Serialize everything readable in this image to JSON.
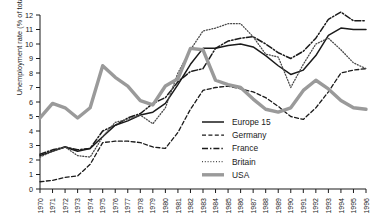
{
  "chart_data": {
    "type": "line",
    "title": "",
    "xlabel": "",
    "ylabel": "Unemployment rate (% of total workforce)",
    "xlim": [
      1970,
      1996
    ],
    "ylim": [
      0,
      12
    ],
    "grid": false,
    "legend_position": "center-right-inside",
    "x": [
      1970,
      1971,
      1972,
      1973,
      1974,
      1975,
      1976,
      1977,
      1978,
      1979,
      1980,
      1981,
      1982,
      1983,
      1984,
      1985,
      1986,
      1987,
      1988,
      1989,
      1990,
      1991,
      1992,
      1993,
      1994,
      1995,
      1996
    ],
    "xtick_labels": [
      "1970",
      "1971",
      "1972",
      "1973",
      "1974",
      "1975",
      "1976",
      "1977",
      "1978",
      "1979",
      "1980",
      "1981",
      "1982",
      "1983",
      "1984",
      "1985",
      "1986",
      "1987",
      "1988",
      "1989",
      "1990",
      "1991",
      "1992",
      "1993",
      "1994",
      "1995",
      "1996"
    ],
    "ytick_labels": [
      "0",
      "1",
      "2",
      "3",
      "4",
      "5",
      "6",
      "7",
      "8",
      "9",
      "10",
      "11",
      "12"
    ],
    "series": [
      {
        "name": "Europe 15",
        "style": "solid",
        "color": "#1a1a1a",
        "width": 1.5,
        "values": [
          2.3,
          2.6,
          2.9,
          2.6,
          2.8,
          3.6,
          4.4,
          4.7,
          5.1,
          5.3,
          5.9,
          7.2,
          8.6,
          9.7,
          9.7,
          9.9,
          10.0,
          9.8,
          9.2,
          8.5,
          7.9,
          8.2,
          9.2,
          10.6,
          11.1,
          11.0,
          11.0
        ]
      },
      {
        "name": "Germany",
        "style": "dashed",
        "color": "#1a1a1a",
        "width": 1.3,
        "values": [
          0.5,
          0.6,
          0.8,
          0.9,
          1.7,
          3.2,
          3.3,
          3.3,
          3.2,
          2.9,
          2.8,
          3.9,
          5.5,
          6.8,
          7.0,
          7.1,
          6.9,
          6.7,
          6.3,
          5.7,
          5.0,
          4.8,
          5.6,
          6.7,
          8.0,
          8.2,
          8.3
        ]
      },
      {
        "name": "France",
        "style": "dashdot",
        "color": "#1a1a1a",
        "width": 1.5,
        "values": [
          2.4,
          2.7,
          2.9,
          2.7,
          2.8,
          4.0,
          4.4,
          4.9,
          5.2,
          5.9,
          6.3,
          7.4,
          8.1,
          8.3,
          9.7,
          10.2,
          10.4,
          10.5,
          10.0,
          9.4,
          9.0,
          9.5,
          10.4,
          11.7,
          12.2,
          11.6,
          11.6
        ]
      },
      {
        "name": "Britain",
        "style": "dotted",
        "color": "#4a4a4a",
        "width": 1.3,
        "values": [
          2.2,
          2.6,
          2.9,
          2.3,
          2.2,
          3.6,
          4.6,
          4.8,
          5.1,
          4.5,
          5.6,
          8.0,
          9.6,
          10.9,
          11.1,
          11.4,
          11.4,
          10.5,
          9.3,
          9.1,
          7.0,
          8.6,
          10.0,
          10.4,
          9.6,
          8.7,
          8.3
        ]
      },
      {
        "name": "USA",
        "style": "thick-solid",
        "color": "#9a9a9a",
        "width": 3.4,
        "values": [
          4.9,
          5.9,
          5.6,
          4.9,
          5.6,
          8.5,
          7.7,
          7.1,
          6.1,
          5.8,
          7.1,
          7.6,
          9.7,
          9.6,
          7.5,
          7.2,
          7.0,
          6.2,
          5.5,
          5.3,
          5.6,
          6.8,
          7.5,
          6.9,
          6.1,
          5.6,
          5.5
        ]
      }
    ]
  }
}
